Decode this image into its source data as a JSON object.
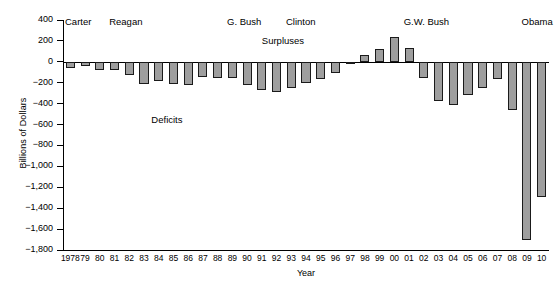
{
  "chart_data": {
    "type": "bar",
    "title": "",
    "xlabel": "Year",
    "ylabel": "Billions of Dollars",
    "ylim": [
      -1800,
      400
    ],
    "ytick_step": 200,
    "grid": false,
    "legend_position": "none",
    "bar_fill_color": "#9e9e9e",
    "bar_border_color": "#1a1a1a",
    "categories": [
      "1978",
      "79",
      "80",
      "81",
      "82",
      "83",
      "84",
      "85",
      "86",
      "87",
      "88",
      "89",
      "90",
      "91",
      "92",
      "93",
      "94",
      "95",
      "96",
      "97",
      "98",
      "99",
      "00",
      "01",
      "02",
      "03",
      "04",
      "05",
      "06",
      "07",
      "08",
      "09",
      "10"
    ],
    "full_years": [
      1978,
      1979,
      1980,
      1981,
      1982,
      1983,
      1984,
      1985,
      1986,
      1987,
      1988,
      1989,
      1990,
      1991,
      1992,
      1993,
      1994,
      1995,
      1996,
      1997,
      1998,
      1999,
      2000,
      2001,
      2002,
      2003,
      2004,
      2005,
      2006,
      2007,
      2008,
      2009,
      2010
    ],
    "values": [
      -59,
      -40,
      -74,
      -79,
      -128,
      -208,
      -185,
      -212,
      -221,
      -150,
      -155,
      -153,
      -221,
      -269,
      -290,
      -255,
      -203,
      -164,
      -107,
      -22,
      69,
      126,
      236,
      128,
      -158,
      -378,
      -413,
      -318,
      -248,
      -161,
      -459,
      -1700,
      -1294
    ],
    "ytick_labels": [
      "400",
      "200",
      "0",
      "−200",
      "−400",
      "−600",
      "−800",
      "−1,000",
      "−1,200",
      "−1,400",
      "−1,600",
      "−1,800"
    ],
    "ytick_values": [
      400,
      200,
      0,
      -200,
      -400,
      -600,
      -800,
      -1000,
      -1200,
      -1400,
      -1600,
      -1800
    ],
    "annotations": [
      {
        "text": "Surpluses",
        "value_x": 13.5,
        "value_y": 200
      },
      {
        "text": "Deficits",
        "value_x": 6.0,
        "value_y": -560
      }
    ],
    "era_labels": [
      {
        "label": "Carter",
        "start_index": 0,
        "end_index": 2
      },
      {
        "label": "Reagan",
        "start_index": 3,
        "end_index": 10
      },
      {
        "label": "G. Bush",
        "start_index": 11,
        "end_index": 14
      },
      {
        "label": "Clinton",
        "start_index": 15,
        "end_index": 22
      },
      {
        "label": "G.W. Bush",
        "start_index": 23,
        "end_index": 30
      },
      {
        "label": "Obama",
        "start_index": 31,
        "end_index": 32
      }
    ]
  }
}
